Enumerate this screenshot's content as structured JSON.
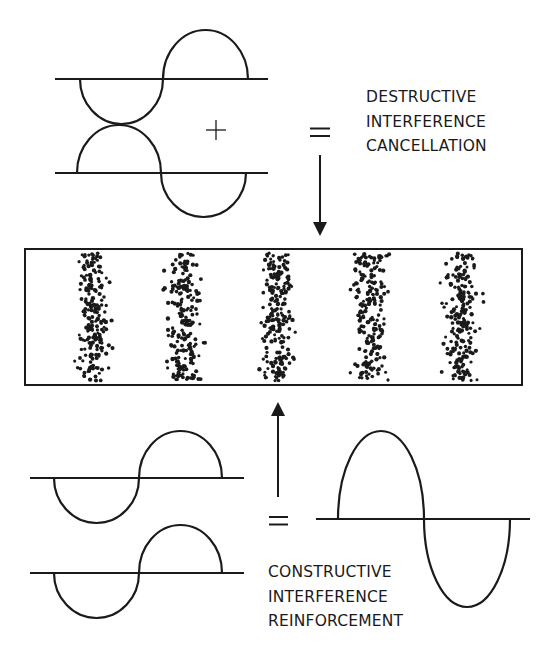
{
  "colors": {
    "ink": "#1a1a1a",
    "background": "#ffffff"
  },
  "destructive": {
    "operator_plus": "+",
    "operator_equals": "=",
    "label_lines": [
      "DESTRUCTIVE",
      "INTERFERENCE",
      "CANCELLATION"
    ],
    "waves": [
      {
        "baseline_y": 79,
        "x1": 55,
        "x2": 268,
        "lobes": [
          {
            "x1": 80,
            "x2": 163,
            "dir": "down",
            "depth": 45
          },
          {
            "x1": 163,
            "x2": 248,
            "dir": "up",
            "depth": 49
          }
        ]
      },
      {
        "baseline_y": 173,
        "x1": 55,
        "x2": 268,
        "lobes": [
          {
            "x1": 77,
            "x2": 161,
            "dir": "up",
            "depth": 48
          },
          {
            "x1": 161,
            "x2": 246,
            "dir": "down",
            "depth": 44
          }
        ]
      }
    ],
    "arrow": {
      "x": 320,
      "y_from": 155,
      "y_to": 236,
      "direction": "down"
    }
  },
  "pattern": {
    "rect": {
      "x": 25,
      "y": 249,
      "w": 497,
      "h": 136
    },
    "bands": [
      {
        "cx": 93
      },
      {
        "cx": 184
      },
      {
        "cx": 277
      },
      {
        "cx": 370
      },
      {
        "cx": 462
      }
    ],
    "band_half_width": 26,
    "dots_per_band": 210
  },
  "constructive": {
    "operator_equals": "=",
    "label_lines": [
      "CONSTRUCTIVE",
      "INTERFERENCE",
      "REINFORCEMENT"
    ],
    "waves": [
      {
        "baseline_y": 478,
        "x1": 30,
        "x2": 244,
        "lobes": [
          {
            "x1": 54,
            "x2": 139,
            "dir": "down",
            "depth": 45
          },
          {
            "x1": 139,
            "x2": 222,
            "dir": "up",
            "depth": 47
          }
        ]
      },
      {
        "baseline_y": 573,
        "x1": 30,
        "x2": 244,
        "lobes": [
          {
            "x1": 54,
            "x2": 139,
            "dir": "down",
            "depth": 45
          },
          {
            "x1": 139,
            "x2": 222,
            "dir": "up",
            "depth": 48
          }
        ]
      }
    ],
    "result_wave": {
      "baseline_y": 519,
      "x1": 316,
      "x2": 530,
      "lobes": [
        {
          "x1": 338,
          "x2": 424,
          "dir": "up",
          "depth": 88
        },
        {
          "x1": 424,
          "x2": 510,
          "dir": "down",
          "depth": 88
        }
      ]
    },
    "arrow": {
      "x": 278,
      "y_from": 497,
      "y_to": 402,
      "direction": "up"
    }
  }
}
